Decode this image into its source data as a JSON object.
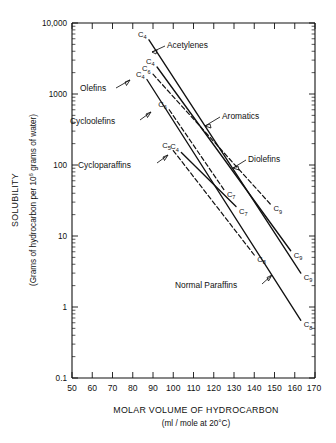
{
  "chart_data": {
    "type": "line",
    "title": "",
    "xlabel": "MOLAR VOLUME OF HYDROCARBON",
    "xlabel_sub": "(ml / mole at 20°C)",
    "ylabel": "SOLUBILITY",
    "ylabel_sub_a": "(Grams of hydrocarbon per 10",
    "ylabel_sub_exp": "6",
    "ylabel_sub_b": "grams of water)",
    "xlim": [
      50,
      170
    ],
    "ylim": [
      0.1,
      10000
    ],
    "yscale": "log",
    "xscale": "linear",
    "grid": false,
    "legend_position": "inline-annotations",
    "xticks": [
      "50",
      "60",
      "70",
      "80",
      "90",
      "100",
      "110",
      "120",
      "130",
      "140",
      "150",
      "160",
      "170"
    ],
    "xtick_values": [
      50,
      60,
      70,
      80,
      90,
      100,
      110,
      120,
      130,
      140,
      150,
      160,
      170
    ],
    "yticks": [
      "10,000",
      "1000",
      "100",
      "10",
      "1",
      "0.1"
    ],
    "ytick_values": [
      10000,
      1000,
      100,
      10,
      1,
      0.1
    ],
    "series": [
      {
        "name": "Acetylenes",
        "style": "solid",
        "start_label": "C",
        "start_sub": "4",
        "end_label": "C",
        "end_sub": "9",
        "x": [
          88,
          163
        ],
        "y": [
          5800,
          3.0
        ]
      },
      {
        "name": "Diolefins",
        "style": "solid",
        "start_label": "C",
        "start_sub": "4",
        "end_label": "C",
        "end_sub": "9",
        "x": [
          92,
          158
        ],
        "y": [
          2400,
          6.2
        ]
      },
      {
        "name": "Aromatics",
        "style": "dashed",
        "start_label": "C",
        "start_sub": "6",
        "end_label": "C",
        "end_sub": "9",
        "x": [
          90,
          148
        ],
        "y": [
          1900,
          28
        ]
      },
      {
        "name": "Olefins",
        "style": "solid",
        "start_label": "C",
        "start_sub": "4",
        "end_label": "C",
        "end_sub": "8",
        "x": [
          87,
          163
        ],
        "y": [
          1600,
          0.65
        ]
      },
      {
        "name": "Cycloolefins",
        "style": "dashed",
        "start_label": "C",
        "start_sub": "6",
        "end_label": "C",
        "end_sub": "7",
        "x": [
          98,
          125
        ],
        "y": [
          600,
          45
        ]
      },
      {
        "name": "Cycloparaffins",
        "style": "dashed",
        "start_label": "C",
        "start_sub": "5",
        "end_label": "C",
        "end_sub": "8",
        "x": [
          100,
          140
        ],
        "y": [
          160,
          5.4
        ]
      },
      {
        "name": "Normal Paraffins",
        "style": "solid",
        "start_label": "C",
        "start_sub": "4",
        "end_label": "C",
        "end_sub": "7",
        "x": [
          104,
          131
        ],
        "y": [
          150,
          26
        ]
      }
    ],
    "annotations": [
      {
        "text": "Acetylenes",
        "x": 118,
        "y": 4000
      },
      {
        "text": "Olefins",
        "x": 72,
        "y": 1100
      },
      {
        "text": "Cycloolefins",
        "x": 67,
        "y": 420
      },
      {
        "text": "Cycloparaffins",
        "x": 74,
        "y": 105
      },
      {
        "text": "Aromatics",
        "x": 128,
        "y": 380
      },
      {
        "text": "Diolefins",
        "x": 142,
        "y": 110
      },
      {
        "text": "Normal Paraffins",
        "x": 110,
        "y": 2.5
      }
    ],
    "carbon_labels": [
      {
        "label": "C",
        "sub": "4"
      },
      {
        "label": "C",
        "sub": "5"
      },
      {
        "label": "C",
        "sub": "6"
      },
      {
        "label": "C",
        "sub": "7"
      },
      {
        "label": "C",
        "sub": "8"
      },
      {
        "label": "C",
        "sub": "9"
      }
    ]
  },
  "axes": {
    "x_title": "MOLAR VOLUME OF HYDROCARBON",
    "x_subtitle": "(ml / mole at 20°C)",
    "y_title": "SOLUBILITY",
    "y_sub_pre": "(Grams of hydrocarbon per 10",
    "y_sub_exp": "6",
    "y_sub_post": "grams of water)"
  },
  "xticklabels": {
    "t0": "50",
    "t1": "60",
    "t2": "70",
    "t3": "80",
    "t4": "90",
    "t5": "100",
    "t6": "110",
    "t7": "120",
    "t8": "130",
    "t9": "140",
    "t10": "150",
    "t11": "160",
    "t12": "170"
  },
  "yticklabels": {
    "y0": "10,000",
    "y1": "1000",
    "y2": "100",
    "y3": "10",
    "y4": "1",
    "y5": "0.1"
  },
  "series_labels": {
    "acetylenes": "Acetylenes",
    "olefins": "Olefins",
    "cycloolefins": "Cycloolefins",
    "cycloparaffins": "Cycloparaffins",
    "aromatics": "Aromatics",
    "diolefins": "Diolefins",
    "normal_paraffins": "Normal Paraffins"
  },
  "carbon_marks": {
    "c_letter": "C",
    "s4": "4",
    "s5": "5",
    "s6": "6",
    "s7": "7",
    "s8": "8",
    "s9": "9"
  },
  "colors": {
    "ink": "#111111",
    "background": "#ffffff"
  }
}
